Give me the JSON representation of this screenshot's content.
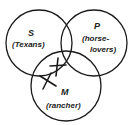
{
  "diagram": {
    "type": "venn-3",
    "circles": [
      {
        "id": "S",
        "letter": "S",
        "description": "(Texans)",
        "cx": 39,
        "cy": 43,
        "r": 33
      },
      {
        "id": "P",
        "letter": "P",
        "description_line1": "(horse-",
        "description_line2": "lovers)",
        "cx": 94,
        "cy": 43,
        "r": 33
      },
      {
        "id": "M",
        "letter": "M",
        "description": "(rancher)",
        "cx": 66,
        "cy": 86,
        "r": 35
      }
    ],
    "marks": [
      {
        "type": "x-mark",
        "region": "S∩P∩M boundary (on P circle within S∩M)",
        "x": 57,
        "y": 67
      },
      {
        "type": "x-mark",
        "region": "S∩M outside P (on S circle edge)",
        "x": 47,
        "y": 81
      }
    ],
    "stroke_color": "#1a1a1a",
    "background": "#ffffff"
  }
}
